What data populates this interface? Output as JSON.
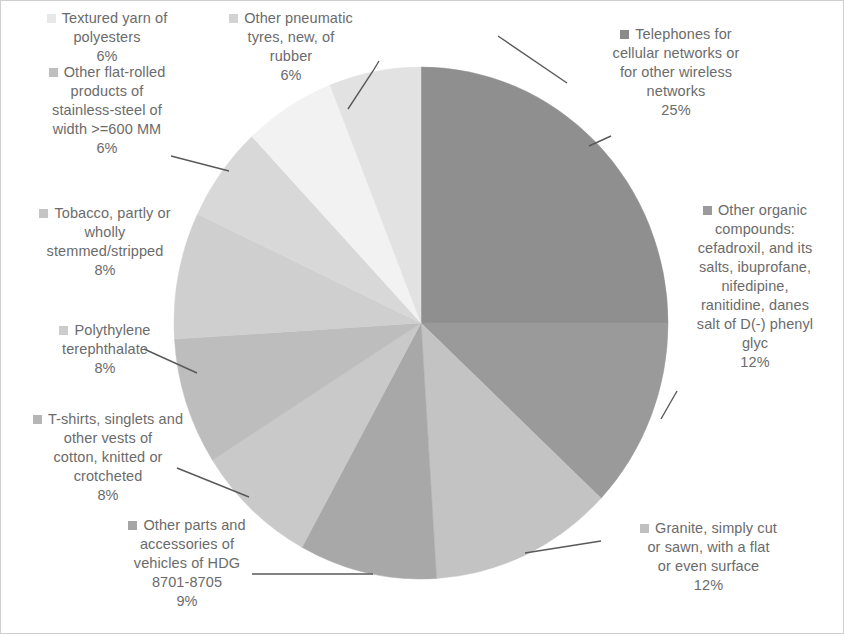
{
  "chart_data": {
    "type": "pie",
    "title": "",
    "legend_position": "callout-labels",
    "grid": false,
    "units": "percent",
    "categories": [
      "Telephones for cellular networks or for other wireless networks",
      "Other organic compounds: cefadroxil, and its salts, ibuprofane, nifedipine, ranitidine, danes salt of D(-) phenyl glyc",
      "Granite, simply cut or sawn, with a flat or even surface",
      "Other parts and accessories of vehicles of HDG 8701-8705",
      "T-shirts, singlets and other vests of cotton, knitted or crotcheted",
      "Polythylene terephthalate",
      "Tobacco, partly or wholly stemmed/stripped",
      "Other flat-rolled products of stainless-steel of width >=600 MM",
      "Textured yarn of polyesters",
      "Other pneumatic tyres, new, of rubber"
    ],
    "values": [
      25,
      12,
      12,
      9,
      8,
      8,
      8,
      6,
      6,
      6
    ],
    "value_labels": [
      "25%",
      "12%",
      "12%",
      "9%",
      "8%",
      "8%",
      "8%",
      "6%",
      "6%",
      "6%"
    ],
    "colors": [
      "#8f8f8f",
      "#9a9a9a",
      "#c3c3c3",
      "#a8a8a8",
      "#c9c9c9",
      "#bdbdbd",
      "#cfcfcf",
      "#d8d8d8",
      "#f2f2f2",
      "#e2e2e2"
    ]
  },
  "slices": [
    {
      "key": "telephones",
      "label": "Telephones for cellular networks or for other wireless networks",
      "lines": [
        "Telephones for",
        "cellular networks or",
        "for other wireless",
        "networks"
      ],
      "percent": "25%",
      "value": 25,
      "color": "#8f8f8f",
      "marker_color": "#8a8a8a"
    },
    {
      "key": "organic-compounds",
      "label": "Other organic compounds: cefadroxil, and its salts, ibuprofane, nifedipine, ranitidine, danes salt of D(-) phenyl glyc",
      "lines": [
        "Other organic",
        "compounds:",
        "cefadroxil, and its",
        "salts, ibuprofane,",
        "nifedipine,",
        "ranitidine, danes",
        "salt of D(-) phenyl",
        "glyc"
      ],
      "percent": "12%",
      "value": 12,
      "color": "#9a9a9a",
      "marker_color": "#9a9a9a"
    },
    {
      "key": "granite",
      "label": "Granite, simply cut or sawn, with a flat or even surface",
      "lines": [
        "Granite, simply cut",
        "or sawn, with a flat",
        "or even surface"
      ],
      "percent": "12%",
      "value": 12,
      "color": "#c3c3c3",
      "marker_color": "#c0c0c0"
    },
    {
      "key": "vehicle-parts",
      "label": "Other parts and accessories of vehicles of HDG 8701-8705",
      "lines": [
        "Other parts and",
        "accessories of",
        "vehicles of HDG",
        "8701-8705"
      ],
      "percent": "9%",
      "value": 9,
      "color": "#a8a8a8",
      "marker_color": "#a5a5a5"
    },
    {
      "key": "t-shirts",
      "label": "T-shirts, singlets and other vests of cotton, knitted or crotcheted",
      "lines": [
        "T-shirts, singlets and",
        "other vests of",
        "cotton, knitted or",
        "crotcheted"
      ],
      "percent": "8%",
      "value": 8,
      "color": "#c9c9c9",
      "marker_color": "#b5b5b5"
    },
    {
      "key": "polythylene",
      "label": "Polythylene terephthalate",
      "lines": [
        "Polythylene",
        "terephthalate"
      ],
      "percent": "8%",
      "value": 8,
      "color": "#bdbdbd",
      "marker_color": "#cccccc"
    },
    {
      "key": "tobacco",
      "label": "Tobacco, partly or wholly stemmed/stripped",
      "lines": [
        "Tobacco, partly or",
        "wholly",
        "stemmed/stripped"
      ],
      "percent": "8%",
      "value": 8,
      "color": "#cfcfcf",
      "marker_color": "#c4c4c4"
    },
    {
      "key": "stainless-steel",
      "label": "Other flat-rolled products of stainless-steel of width >=600 MM",
      "lines": [
        "Other flat-rolled",
        "products of",
        "stainless-steel of",
        "width >=600 MM"
      ],
      "percent": "6%",
      "value": 6,
      "color": "#d8d8d8",
      "marker_color": "#bfbfbf"
    },
    {
      "key": "textured-yarn",
      "label": "Textured yarn of polyesters",
      "lines": [
        "Textured yarn of",
        "polyesters"
      ],
      "percent": "6%",
      "value": 6,
      "color": "#f2f2f2",
      "marker_color": "#e8e8e8"
    },
    {
      "key": "pneumatic-tyres",
      "label": "Other pneumatic tyres, new, of rubber",
      "lines": [
        "Other pneumatic",
        "tyres, new, of",
        "rubber"
      ],
      "percent": "6%",
      "value": 6,
      "color": "#e2e2e2",
      "marker_color": "#d2d2d2"
    }
  ]
}
